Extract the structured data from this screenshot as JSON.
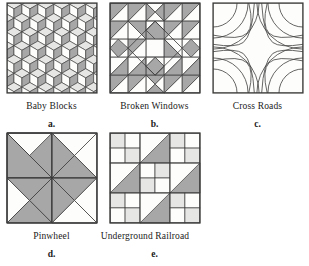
{
  "page": {
    "kind": "quilt-block-figure-plate",
    "background": "#ffffff",
    "figure_count": 5
  },
  "palette": {
    "dark_gray": "#a7a7a7",
    "light_gray": "#e6e6e4",
    "white": "#fdfdfb",
    "outline": "#3b3b3b",
    "text": "#1a1a1a"
  },
  "figures": [
    {
      "id": "baby-blocks",
      "name": "Baby Blocks",
      "letter": "a.",
      "description": "Tumbling-block isometric cubes; each cube is three rhombi shaded light-gray (top), white (left face) and medium-gray (right face)."
    },
    {
      "id": "broken-windows",
      "name": "Broken Windows",
      "letter": "b.",
      "description": "Five-by-five grid of half-square triangles forming a concentric diamond around a plain white center square."
    },
    {
      "id": "cross-roads",
      "name": "Cross Roads",
      "letter": "c.",
      "description": "Unshaded line block of quarter-circle arcs from each corner crossing in the middle to form an X / curved cross."
    },
    {
      "id": "pinwheel",
      "name": "Pinwheel",
      "letter": "d.",
      "description": "Four quadrants, each split into rotating triangle blades, spinning about the block center."
    },
    {
      "id": "underground-railroad",
      "name": "Underground Railroad",
      "letter": "e.",
      "description": "Nine-patch of four-patch units with a medium-gray diagonal stripe of half-square triangles running corner to corner."
    }
  ],
  "rows": [
    {
      "figure_ids": [
        "baby-blocks",
        "broken-windows",
        "cross-roads"
      ]
    },
    {
      "figure_ids": [
        "pinwheel",
        "underground-railroad"
      ]
    }
  ]
}
